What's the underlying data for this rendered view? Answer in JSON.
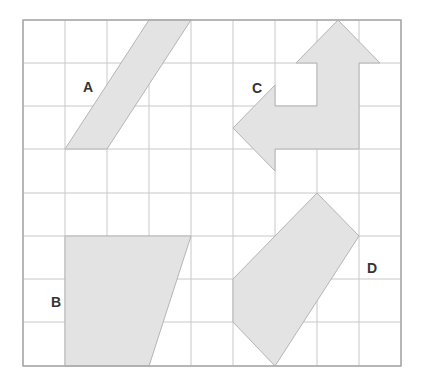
{
  "diagram": {
    "type": "grid-shapes",
    "grid": {
      "columns": 9,
      "rows": 8,
      "col_x": [
        23,
        65,
        107,
        149,
        191,
        233,
        275,
        317,
        359,
        401
      ],
      "row_y": [
        20,
        63,
        106,
        149,
        193,
        236,
        279,
        322,
        366
      ],
      "line_color": "#c8c8c8",
      "border_color": "#a8a8a8"
    },
    "fill_color": "#e3e3e3",
    "stroke_color": "#b5b5b5",
    "shapes": [
      {
        "id": "A",
        "label": "A",
        "label_pos": [
          88,
          87
        ],
        "points": [
          [
            65,
            149
          ],
          [
            107,
            149
          ],
          [
            191,
            20
          ],
          [
            149,
            20
          ]
        ]
      },
      {
        "id": "B",
        "label": "B",
        "label_pos": [
          56,
          302
        ],
        "points": [
          [
            65,
            236
          ],
          [
            191,
            236
          ],
          [
            149,
            366
          ],
          [
            65,
            366
          ]
        ]
      },
      {
        "id": "C",
        "label": "C",
        "label_pos": [
          257,
          88
        ],
        "points": [
          [
            338,
            20
          ],
          [
            380,
            63
          ],
          [
            359,
            63
          ],
          [
            359,
            149
          ],
          [
            275,
            149
          ],
          [
            275,
            171
          ],
          [
            233,
            128
          ],
          [
            275,
            85
          ],
          [
            275,
            106
          ],
          [
            317,
            106
          ],
          [
            317,
            63
          ],
          [
            296,
            63
          ]
        ]
      },
      {
        "id": "D",
        "label": "D",
        "label_pos": [
          372,
          268
        ],
        "points": [
          [
            317,
            193
          ],
          [
            359,
            236
          ],
          [
            275,
            366
          ],
          [
            233,
            322
          ],
          [
            233,
            279
          ]
        ]
      }
    ]
  }
}
